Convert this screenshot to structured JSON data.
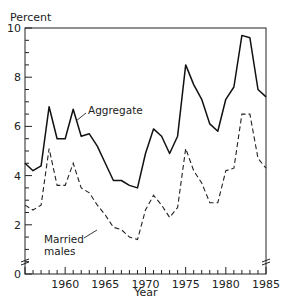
{
  "chart_data": {
    "type": "line",
    "title": "",
    "xlabel": "Year",
    "ylabel": "Percent",
    "xlim": [
      1955,
      1985
    ],
    "ylim": [
      0,
      10
    ],
    "x_ticks": [
      1960,
      1965,
      1970,
      1975,
      1980,
      1985
    ],
    "y_ticks": [
      0,
      2,
      4,
      6,
      8,
      10
    ],
    "grid": false,
    "legend": "inline annotations",
    "x": [
      1955,
      1956,
      1957,
      1958,
      1959,
      1960,
      1961,
      1962,
      1963,
      1964,
      1965,
      1966,
      1967,
      1968,
      1969,
      1970,
      1971,
      1972,
      1973,
      1974,
      1975,
      1976,
      1977,
      1978,
      1979,
      1980,
      1981,
      1982,
      1983,
      1984,
      1985
    ],
    "series": [
      {
        "name": "Aggregate",
        "style": "solid",
        "values": [
          4.5,
          4.2,
          4.4,
          6.8,
          5.5,
          5.5,
          6.7,
          5.6,
          5.7,
          5.2,
          4.5,
          3.8,
          3.8,
          3.6,
          3.5,
          4.9,
          5.9,
          5.6,
          4.9,
          5.6,
          8.5,
          7.7,
          7.1,
          6.1,
          5.8,
          7.1,
          7.6,
          9.7,
          9.6,
          7.5,
          7.2
        ]
      },
      {
        "name": "Married males",
        "style": "dashed",
        "values": [
          2.8,
          2.6,
          2.8,
          5.1,
          3.6,
          3.6,
          4.5,
          3.5,
          3.3,
          2.8,
          2.4,
          1.9,
          1.8,
          1.5,
          1.4,
          2.6,
          3.2,
          2.8,
          2.3,
          2.7,
          5.1,
          4.2,
          3.7,
          2.9,
          2.9,
          4.2,
          4.3,
          6.5,
          6.5,
          4.7,
          4.3
        ]
      }
    ],
    "annotations": [
      {
        "text": "Aggregate",
        "series": "Aggregate"
      },
      {
        "text": "Married",
        "series": "Married males"
      },
      {
        "text": "males",
        "series": "Married males"
      }
    ],
    "axis_break": true
  },
  "labels": {
    "y_axis_title": "Percent",
    "x_axis_title": "Year",
    "aggregate": "Aggregate",
    "married_line1": "Married",
    "married_line2": "males",
    "y_tick_labels": [
      "0",
      "2",
      "4",
      "6",
      "8",
      "10"
    ],
    "x_tick_labels": [
      "1960",
      "1965",
      "1970",
      "1975",
      "1980",
      "1985"
    ]
  }
}
